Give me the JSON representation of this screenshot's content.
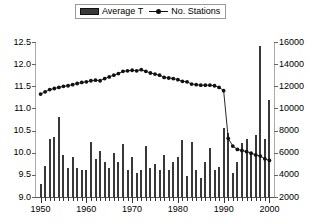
{
  "legend": {
    "items": [
      {
        "label": "Average T",
        "type": "bar",
        "color": "#383838"
      },
      {
        "label": "No. Stations",
        "type": "line",
        "color": "#111111"
      }
    ]
  },
  "axes": {
    "left": {
      "ticks": [
        "9.0",
        "9.5",
        "10.0",
        "10.5",
        "11.0",
        "11.5",
        "12.0",
        "12.5"
      ],
      "min": 9.0,
      "max": 12.5,
      "step": 0.5
    },
    "right": {
      "ticks": [
        "2000",
        "4000",
        "6000",
        "8000",
        "10000",
        "12000",
        "14000",
        "16000"
      ],
      "min": 2000,
      "max": 16000,
      "step": 2000
    },
    "bottom": {
      "ticks": [
        "1950",
        "1960",
        "1970",
        "1980",
        "1990",
        "2000"
      ],
      "min": 1949,
      "max": 2001
    }
  },
  "chart_data": {
    "type": "bar",
    "title": "",
    "xlabel": "",
    "ylabel": "",
    "ylim": [
      9.0,
      12.5
    ],
    "y2lim": [
      2000,
      16000
    ],
    "xlim": [
      1949,
      2001
    ],
    "grid": false,
    "legend_position": "top-center",
    "x": [
      1950,
      1951,
      1952,
      1953,
      1954,
      1955,
      1956,
      1957,
      1958,
      1959,
      1960,
      1961,
      1962,
      1963,
      1964,
      1965,
      1966,
      1967,
      1968,
      1969,
      1970,
      1971,
      1972,
      1973,
      1974,
      1975,
      1976,
      1977,
      1978,
      1979,
      1980,
      1981,
      1982,
      1983,
      1984,
      1985,
      1986,
      1987,
      1988,
      1989,
      1990,
      1991,
      1992,
      1993,
      1994,
      1995,
      1996,
      1997,
      1998,
      1999,
      2000
    ],
    "series": [
      {
        "name": "Average T",
        "axis": "left",
        "type": "bar",
        "color": "#383838",
        "values": [
          9.3,
          9.7,
          10.3,
          10.35,
          10.8,
          9.95,
          9.65,
          9.9,
          9.65,
          9.62,
          9.62,
          10.25,
          9.85,
          10.05,
          9.8,
          9.65,
          10.0,
          9.8,
          10.2,
          9.6,
          9.9,
          9.55,
          9.6,
          10.15,
          9.65,
          9.75,
          9.6,
          9.95,
          9.62,
          9.78,
          9.9,
          10.28,
          9.48,
          10.25,
          9.62,
          9.42,
          9.8,
          10.1,
          9.6,
          9.68,
          10.55,
          10.45,
          9.55,
          9.8,
          10.22,
          10.32,
          10.02,
          10.4,
          12.4,
          10.3,
          11.2
        ]
      },
      {
        "name": "No. Stations",
        "axis": "right",
        "type": "line",
        "color": "#111111",
        "marker": "circle",
        "values": [
          11300,
          11500,
          11700,
          11800,
          11900,
          12000,
          12050,
          12150,
          12250,
          12350,
          12400,
          12500,
          12550,
          12500,
          12700,
          12850,
          13000,
          13150,
          13350,
          13400,
          13450,
          13400,
          13500,
          13350,
          13200,
          13100,
          13000,
          12800,
          12750,
          12700,
          12600,
          12450,
          12400,
          12200,
          12150,
          12100,
          12100,
          12100,
          12050,
          11900,
          11600,
          7300,
          6600,
          6300,
          6200,
          6100,
          5950,
          5800,
          5700,
          5450,
          5300
        ]
      }
    ]
  }
}
